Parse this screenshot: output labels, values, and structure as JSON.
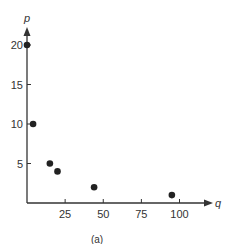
{
  "chart_data": {
    "type": "scatter",
    "title": "",
    "caption": "(a)",
    "xlabel": "q",
    "ylabel": "p",
    "xlim": [
      0,
      110
    ],
    "ylim": [
      0,
      22
    ],
    "x_ticks": [
      25,
      50,
      75,
      100
    ],
    "y_ticks": [
      5,
      10,
      15,
      20
    ],
    "grid": false,
    "legend": null,
    "points": [
      {
        "q": 0,
        "p": 20
      },
      {
        "q": 4,
        "p": 10
      },
      {
        "q": 15,
        "p": 5
      },
      {
        "q": 20,
        "p": 4
      },
      {
        "q": 44,
        "p": 2
      },
      {
        "q": 95,
        "p": 1
      }
    ],
    "colors": {
      "axis": "#333333",
      "point": "#222222"
    }
  }
}
